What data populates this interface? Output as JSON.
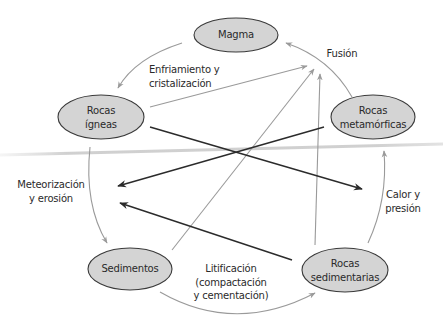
{
  "diagram": {
    "colors": {
      "node_fill": "#d4d4d4",
      "node_stroke": "#3a3a3a",
      "text": "#2a2a2a",
      "light_arrow": "#9a9a9a",
      "dark_arrow": "#2b2b2b",
      "scan_smudge": "#c8c8c8"
    },
    "nodes": [
      {
        "id": "magma",
        "lines": [
          "Magma"
        ]
      },
      {
        "id": "igneas",
        "lines": [
          "Rocas",
          "ígneas"
        ]
      },
      {
        "id": "metamorficas",
        "lines": [
          "Rocas",
          "metamórficas"
        ]
      },
      {
        "id": "sedimentos",
        "lines": [
          "Sedimentos"
        ]
      },
      {
        "id": "sedimentarias",
        "lines": [
          "Rocas",
          "sedimentarias"
        ]
      }
    ],
    "edge_labels": [
      {
        "id": "enfriamiento",
        "lines": [
          "Enfriamiento y",
          "cristalización"
        ]
      },
      {
        "id": "fusion",
        "lines": [
          "Fusión"
        ]
      },
      {
        "id": "meteorizacion",
        "lines": [
          "Meteorización",
          "y erosión"
        ]
      },
      {
        "id": "calor",
        "lines": [
          "Calor y",
          "presión"
        ]
      },
      {
        "id": "litificacion",
        "lines": [
          "Litificación",
          "(compactación",
          "y cementación)"
        ]
      }
    ],
    "edges": [
      {
        "from": "magma",
        "to": "igneas",
        "label": "Enfriamiento y cristalización",
        "style": "light-curve"
      },
      {
        "from": "metamorficas",
        "to": "magma",
        "label": "Fusión",
        "style": "light-curve"
      },
      {
        "from": "igneas",
        "to": "sedimentos",
        "label": "Meteorización y erosión",
        "style": "light-curve"
      },
      {
        "from": "sedimentos",
        "to": "sedimentarias",
        "label": "Litificación (compactación y cementación)",
        "style": "light-curve"
      },
      {
        "from": "sedimentarias",
        "to": "metamorficas",
        "label": "Calor y presión",
        "style": "light-curve"
      },
      {
        "from": "igneas",
        "to": "fusion",
        "style": "light-straight"
      },
      {
        "from": "sedimentos",
        "to": "fusion",
        "style": "light-straight"
      },
      {
        "from": "sedimentarias",
        "to": "fusion",
        "style": "light-straight"
      },
      {
        "from": "igneas",
        "to": "calor",
        "style": "dark-straight"
      },
      {
        "from": "metamorficas",
        "to": "meteorizacion",
        "style": "dark-straight"
      },
      {
        "from": "sedimentarias",
        "to": "meteorizacion",
        "style": "dark-straight"
      }
    ]
  }
}
